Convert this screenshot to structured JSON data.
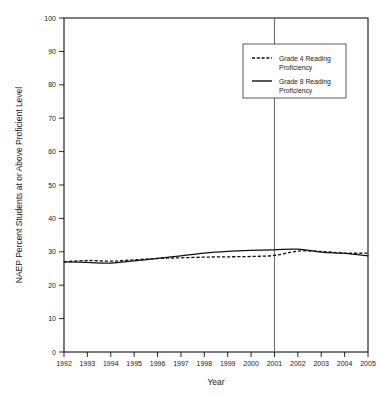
{
  "chart_data": {
    "type": "line",
    "title": "",
    "xlabel": "Year",
    "ylabel": "NAEP Percent Students at or Above Proficient Level",
    "x": [
      1992,
      1993,
      1994,
      1995,
      1996,
      1997,
      1998,
      1999,
      2000,
      2001,
      2002,
      2003,
      2004,
      2005
    ],
    "categories": [
      "1992",
      "1993",
      "1994",
      "1995",
      "1996",
      "1997",
      "1998",
      "1999",
      "2000",
      "2001",
      "2002",
      "2003",
      "2004",
      "2005"
    ],
    "xlim": [
      1992,
      2005
    ],
    "ylim": [
      0,
      100
    ],
    "yticks": [
      0,
      10,
      20,
      30,
      40,
      50,
      60,
      70,
      80,
      90,
      100
    ],
    "ytick_labels": [
      "0",
      "10",
      "20",
      "30",
      "40",
      "50",
      "60",
      "70",
      "80",
      "90",
      "100"
    ],
    "grid": false,
    "legend_position": "top-right",
    "series": [
      {
        "name": "Grade 4 Reading Proficiency",
        "style": "dashed",
        "color": "#111111",
        "values": [
          27.0,
          27.4,
          27.2,
          27.6,
          28.0,
          28.2,
          28.4,
          28.5,
          28.6,
          28.9,
          30.2,
          30.1,
          29.6,
          29.6
        ]
      },
      {
        "name": "Grade 8 Reading Proficiency",
        "style": "solid",
        "color": "#111111",
        "values": [
          27.0,
          26.8,
          26.6,
          27.3,
          28.0,
          28.8,
          29.6,
          30.1,
          30.4,
          30.6,
          30.8,
          29.9,
          29.5,
          28.8
        ]
      }
    ],
    "annotations": [
      {
        "name": "year-2001-reference-line",
        "type": "vline",
        "x": 2001,
        "color": "#555555"
      }
    ],
    "legend_entries": [
      {
        "label_line1": "Grade 4 Reading",
        "label_line2": "Proficiency",
        "style": "dashed"
      },
      {
        "label_line1": "Grade 8 Reading",
        "label_line2": "Proficiency",
        "style": "solid"
      }
    ]
  }
}
